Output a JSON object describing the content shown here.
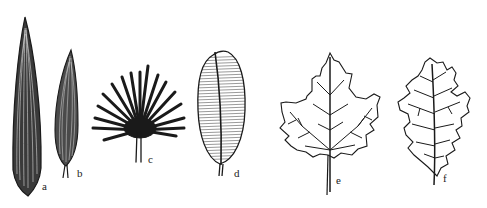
{
  "figure": {
    "leaves": [
      {
        "id": "a",
        "label": "a",
        "venation": "parallel (long, linear leaf)"
      },
      {
        "id": "b",
        "label": "b",
        "venation": "arcuate / curved-parallel (lanceolate leaf)"
      },
      {
        "id": "c",
        "label": "c",
        "venation": "radiate / palmate fan"
      },
      {
        "id": "d",
        "label": "d",
        "venation": "pinnate parallel (midrib with many parallel laterals)"
      },
      {
        "id": "e",
        "label": "e",
        "venation": "palmate net (maple-like leaf)"
      },
      {
        "id": "f",
        "label": "f",
        "venation": "pinnate net (oak-like leaf)"
      }
    ]
  },
  "colors": {
    "ink": "#1a1a1a",
    "background": "#ffffff"
  }
}
